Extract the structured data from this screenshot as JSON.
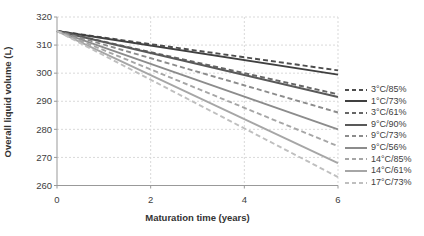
{
  "figure": {
    "kind": "line-chart"
  },
  "chart_data": {
    "type": "line",
    "title": "",
    "xlabel": "Maturation time (years)",
    "ylabel": "Overall liquid volume (L)",
    "xlim": [
      0,
      6
    ],
    "ylim": [
      260,
      320
    ],
    "xticks": [
      0,
      2,
      4,
      6
    ],
    "yticks": [
      260,
      270,
      280,
      290,
      300,
      310,
      320
    ],
    "grid": true,
    "legend_position": "right",
    "x": [
      0,
      6
    ],
    "series": [
      {
        "name": "3°C/85%",
        "style": "dashed",
        "color": "#4d4d4d",
        "values": [
          315,
          301
        ]
      },
      {
        "name": "1°C/73%",
        "style": "solid",
        "color": "#404040",
        "values": [
          315,
          299.5
        ]
      },
      {
        "name": "3°C/61%",
        "style": "dashed",
        "color": "#666666",
        "values": [
          315,
          292.5
        ]
      },
      {
        "name": "9°C/90%",
        "style": "solid",
        "color": "#595959",
        "values": [
          315,
          291.5
        ]
      },
      {
        "name": "9°C/73%",
        "style": "dashed",
        "color": "#8c8c8c",
        "values": [
          315,
          286
        ]
      },
      {
        "name": "9°C/56%",
        "style": "solid",
        "color": "#8c8c8c",
        "values": [
          315,
          280
        ]
      },
      {
        "name": "14°C/85%",
        "style": "dashed",
        "color": "#a6a6a6",
        "values": [
          315,
          274
        ]
      },
      {
        "name": "14°C/61%",
        "style": "solid",
        "color": "#a6a6a6",
        "values": [
          315,
          268
        ]
      },
      {
        "name": "17°C/73%",
        "style": "dashed",
        "color": "#bfbfbf",
        "values": [
          315,
          263
        ]
      }
    ],
    "colors": {
      "axis": "#999999",
      "grid": "#d9d9d9",
      "text": "#404040"
    }
  }
}
